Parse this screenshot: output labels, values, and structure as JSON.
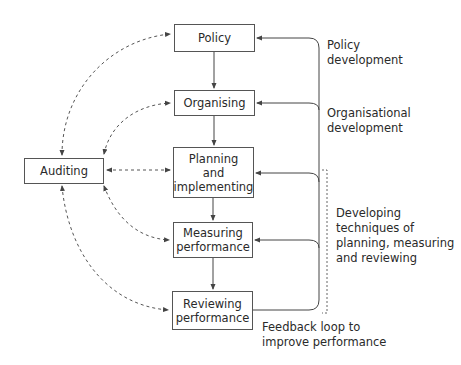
{
  "diagram": {
    "nodes": {
      "policy": "Policy",
      "organising": "Organising",
      "planning": "Planning\nand\nimplementing",
      "measuring": "Measuring\nperformance",
      "reviewing": "Reviewing\nperformance",
      "auditing": "Auditing"
    },
    "annotations": {
      "policy_development": "Policy\ndevelopment",
      "organisational_development": "Organisational\ndevelopment",
      "developing_techniques": "Developing\ntechniques of\nplanning, measuring\nand reviewing",
      "feedback_loop": "Feedback loop to\nimprove performance"
    },
    "edges": [
      {
        "from": "Policy",
        "to": "Organising",
        "style": "solid"
      },
      {
        "from": "Organising",
        "to": "Planning and implementing",
        "style": "solid"
      },
      {
        "from": "Planning and implementing",
        "to": "Measuring performance",
        "style": "solid"
      },
      {
        "from": "Measuring performance",
        "to": "Reviewing performance",
        "style": "solid"
      },
      {
        "from": "Reviewing performance",
        "to": "Policy",
        "style": "solid",
        "label": "Feedback loop to improve performance"
      },
      {
        "from": "Reviewing performance",
        "to": "Organising",
        "style": "solid"
      },
      {
        "from": "Reviewing performance",
        "to": "Planning and implementing",
        "style": "solid"
      },
      {
        "from": "Reviewing performance",
        "to": "Measuring performance",
        "style": "solid"
      },
      {
        "from": "Auditing",
        "to": "Policy",
        "style": "dashed",
        "bidirectional": true
      },
      {
        "from": "Auditing",
        "to": "Organising",
        "style": "dashed",
        "bidirectional": true
      },
      {
        "from": "Auditing",
        "to": "Planning and implementing",
        "style": "dashed",
        "bidirectional": true
      },
      {
        "from": "Auditing",
        "to": "Measuring performance",
        "style": "dashed",
        "bidirectional": true
      },
      {
        "from": "Auditing",
        "to": "Reviewing performance",
        "style": "dashed",
        "bidirectional": true
      }
    ],
    "colors": {
      "line": "#444444",
      "dashed": "#555555",
      "text": "#2a2a2a",
      "background": "#ffffff"
    }
  }
}
